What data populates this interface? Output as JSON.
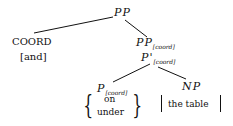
{
  "diagram": {
    "type": "syntax-tree",
    "root": {
      "label": "PP",
      "children": [
        {
          "label": "COORD",
          "lexical": "[and]"
        },
        {
          "label": "PP",
          "subscript": "[coord]",
          "children": [
            {
              "label": "P'",
              "subscript": "[coord]",
              "children": [
                {
                  "label": "P",
                  "subscript": "[coord]",
                  "lexical_options": [
                    "on",
                    "under"
                  ]
                },
                {
                  "label": "NP",
                  "lexical": "the table"
                }
              ]
            }
          ]
        }
      ]
    },
    "nodes": {
      "pp_root": "PP",
      "coord": "COORD",
      "coord_word": "[and]",
      "pp_coord": "PP",
      "pp_coord_sub": "[coord]",
      "pbar_coord": "P'",
      "pbar_coord_sub": "[coord]",
      "p_coord": "P",
      "p_coord_sub": "[coord]",
      "p_opt1": "on",
      "p_opt2": "under",
      "np": "NP",
      "np_word": "the table"
    },
    "colors": {
      "ink": "#111111",
      "background": "#ffffff"
    }
  }
}
